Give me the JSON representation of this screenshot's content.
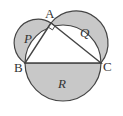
{
  "diagram": {
    "vertices": {
      "A": "A",
      "B": "B",
      "C": "C"
    },
    "regions": {
      "P": "P",
      "Q": "Q",
      "R": "R"
    },
    "right_angle_at": "A",
    "colors": {
      "fill": "#c8c8c8",
      "stroke": "#444444",
      "triangle": "#ffffff"
    }
  }
}
